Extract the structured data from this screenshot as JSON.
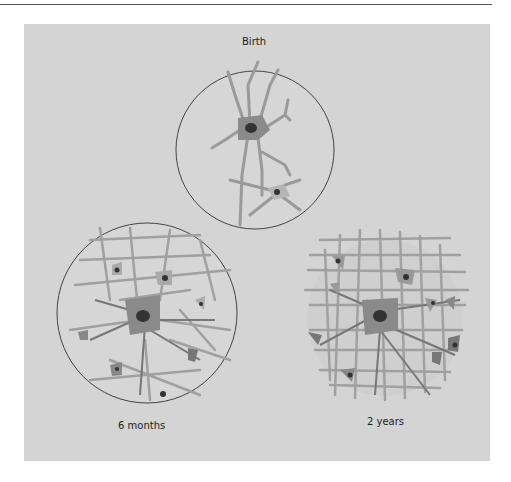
{
  "figure": {
    "panels": [
      {
        "label": "Birth"
      },
      {
        "label": "6 months"
      },
      {
        "label": "2 years"
      }
    ],
    "colors": {
      "background": "#d4d4d4",
      "dendrite": "#9a9a9a",
      "cell_body": "#8a8a8a",
      "nucleus": "#333333",
      "outline": "#444444"
    }
  }
}
